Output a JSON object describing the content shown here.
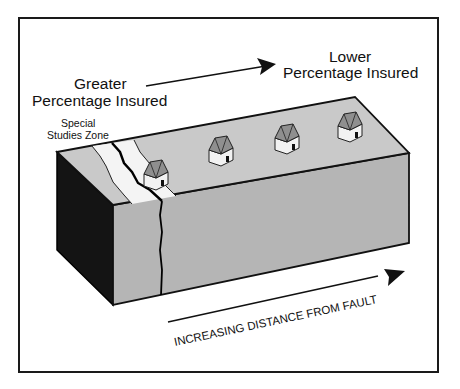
{
  "diagram": {
    "labels": {
      "greater_line1": "Greater",
      "greater_line2": "Percentage Insured",
      "lower_line1": "Lower",
      "lower_line2": "Percentage Insured",
      "zone_line1": "Special",
      "zone_line2": "Studies Zone",
      "axis": "INCREASING DISTANCE FROM FAULT"
    },
    "houses_count": 4,
    "colors": {
      "frame": "#1a1a1a",
      "top_face": "#c9c9c9",
      "front_face": "#b5b5b5",
      "side_face": "#141414",
      "zone_strip": "#f4f4f4",
      "roof": "#8f8f8f",
      "house_wall": "#f2f2f2"
    }
  }
}
